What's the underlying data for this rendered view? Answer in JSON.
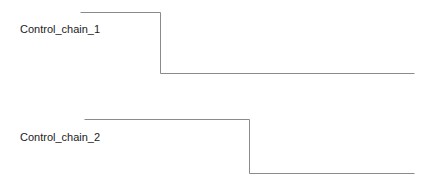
{
  "diagram": {
    "type": "timing",
    "line_color": "#8a8a8a",
    "chains": [
      {
        "label": "Control_chain_1",
        "label_pos": [
          20,
          23
        ],
        "waveform": [
          [
            80,
            12
          ],
          [
            160,
            12
          ],
          [
            160,
            73
          ],
          [
            414,
            73
          ]
        ]
      },
      {
        "label": "Control_chain_2",
        "label_pos": [
          20,
          131
        ],
        "waveform": [
          [
            84,
            119
          ],
          [
            249,
            119
          ],
          [
            249,
            173
          ],
          [
            414,
            173
          ]
        ]
      }
    ]
  }
}
